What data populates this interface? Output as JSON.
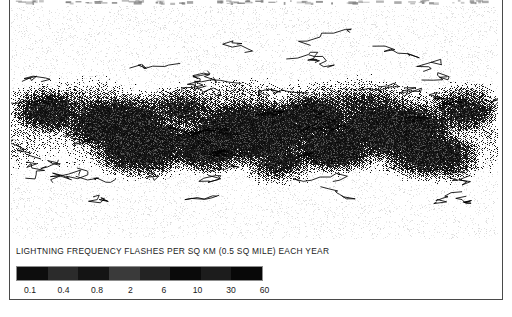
{
  "figure": {
    "background_color": "#ffffff",
    "frame_color": "#4a4a4a"
  },
  "map": {
    "name": "world-lightning-frequency-map",
    "description": "Global halftone raster map of lightning flash frequency",
    "projection_style": "equirectangular",
    "render_style": "dithered-grayscale-halftone",
    "ocean_fill": "#ffffff",
    "land_fill": "#111111"
  },
  "legend": {
    "title": "LIGHTNING FREQUENCY FLASHES PER SQ KM (0.5 SQ MILE) EACH YEAR",
    "tick_labels": [
      "0.1",
      "0.4",
      "0.8",
      "2",
      "6",
      "10",
      "30",
      "60"
    ],
    "segment_colors": [
      "#0d0d0d",
      "#2b2b2b",
      "#141414",
      "#3a3a3a",
      "#232323",
      "#0a0a0a",
      "#1c1c1c",
      "#080808"
    ]
  },
  "chart_data": {
    "type": "heatmap",
    "title": "LIGHTNING FREQUENCY FLASHES PER SQ KM (0.5 SQ MILE) EACH YEAR",
    "xlabel": "",
    "ylabel": "",
    "colorbar_label": "LIGHTNING FREQUENCY FLASHES PER SQ KM (0.5 SQ MILE) EACH YEAR",
    "colorbar_ticks": [
      0.1,
      0.4,
      0.8,
      2,
      6,
      10,
      30,
      60
    ],
    "colorbar_tick_labels": [
      "0.1",
      "0.4",
      "0.8",
      "2",
      "6",
      "10",
      "30",
      "60"
    ],
    "units": "flashes per sq km per year",
    "scale": "logarithmic",
    "zlim": [
      0.1,
      60
    ],
    "grid": false,
    "legend_position": "bottom-left",
    "colormap": "grayscale-halftone"
  }
}
